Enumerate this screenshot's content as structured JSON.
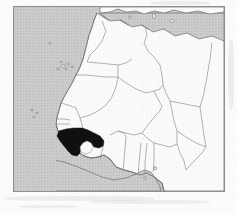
{
  "figure": {
    "kind": "locator-map",
    "region": "West Africa and North-west Africa",
    "highlight_country": "Guinea",
    "caption": "",
    "title": ""
  },
  "colors": {
    "ocean": "#c9c9c9",
    "land": "#fafafa",
    "border_line": "#8a8a8a",
    "coast_line": "#6e6e6e",
    "frame": "#8e8e8e",
    "highlight": "#101010",
    "page": "#fbfbfb"
  },
  "map": {
    "frame": {
      "x": 13,
      "y": 6,
      "width": 212,
      "height": 186
    },
    "water_bodies": [
      {
        "name": "Atlantic Ocean",
        "position": "west"
      },
      {
        "name": "Mediterranean Sea",
        "position": "north"
      },
      {
        "name": "Gulf of Guinea",
        "position": "south"
      }
    ],
    "islands": [
      {
        "name": "Canary Islands",
        "position": "north-west-offshore"
      },
      {
        "name": "Cape Verde",
        "position": "west-offshore"
      },
      {
        "name": "Bioko",
        "position": "gulf-of-guinea"
      },
      {
        "name": "Balearic Islands",
        "position": "mediterranean"
      },
      {
        "name": "Sicily",
        "position": "mediterranean"
      }
    ],
    "countries": [
      {
        "name": "Morocco",
        "highlighted": false
      },
      {
        "name": "Western Sahara",
        "highlighted": false
      },
      {
        "name": "Algeria",
        "highlighted": false
      },
      {
        "name": "Tunisia",
        "highlighted": false
      },
      {
        "name": "Libya",
        "highlighted": false
      },
      {
        "name": "Mauritania",
        "highlighted": false
      },
      {
        "name": "Mali",
        "highlighted": false
      },
      {
        "name": "Niger",
        "highlighted": false
      },
      {
        "name": "Chad",
        "highlighted": false
      },
      {
        "name": "Senegal",
        "highlighted": false
      },
      {
        "name": "Gambia",
        "highlighted": false
      },
      {
        "name": "Guinea-Bissau",
        "highlighted": false
      },
      {
        "name": "Guinea",
        "highlighted": true
      },
      {
        "name": "Sierra Leone",
        "highlighted": false
      },
      {
        "name": "Liberia",
        "highlighted": false
      },
      {
        "name": "Ivory Coast",
        "highlighted": false
      },
      {
        "name": "Burkina Faso",
        "highlighted": false
      },
      {
        "name": "Ghana",
        "highlighted": false
      },
      {
        "name": "Togo",
        "highlighted": false
      },
      {
        "name": "Benin",
        "highlighted": false
      },
      {
        "name": "Nigeria",
        "highlighted": false
      },
      {
        "name": "Cameroon",
        "highlighted": false
      },
      {
        "name": "Central African Republic",
        "highlighted": false
      }
    ]
  }
}
